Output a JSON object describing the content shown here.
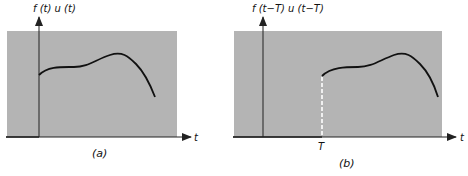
{
  "figure": {
    "panels": [
      {
        "id": "a",
        "caption": "(a)",
        "y_axis_label": "f (t) u (t)",
        "x_axis_label": "t",
        "shift_label": ""
      },
      {
        "id": "b",
        "caption": "(b)",
        "y_axis_label": "f (t−T) u (t−T)",
        "x_axis_label": "t",
        "shift_label": "T"
      }
    ],
    "colors": {
      "shaded_region": "#b4b4b4",
      "axis": "#222222",
      "curve": "#111111",
      "dashed_marker": "#ffffff"
    }
  }
}
